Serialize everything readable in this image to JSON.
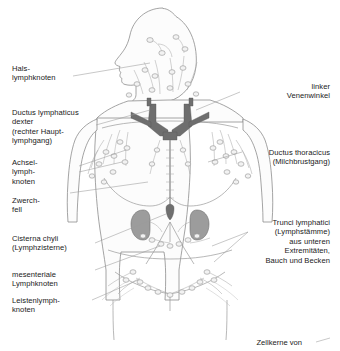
{
  "diagram": {
    "background_color": "#ffffff",
    "line_color": "#8a8a8a",
    "organ_fill": "#9a9a9a",
    "vessel_fill": "#6e6e6e",
    "body_fill": "#fbfbfb"
  },
  "labels_left": [
    {
      "id": "hals",
      "text": "Hals-\nlymphknoten"
    },
    {
      "id": "ductus-lymphaticus-dexter",
      "text": "Ductus lymphaticus\ndexter\n(rechter Haupt-\nlymphgang)"
    },
    {
      "id": "achsel",
      "text": "Achsel-\nlymph-\nknoten"
    },
    {
      "id": "zwerchfell",
      "text": "Zwerch-\nfell"
    },
    {
      "id": "cisterna-chyli",
      "text": "Cisterna chyli\n(Lymphzisterne)"
    },
    {
      "id": "mesenteriale",
      "text": "mesenteriale\nLymphknoten"
    },
    {
      "id": "leisten",
      "text": "Leistenlymph-\nknoten"
    }
  ],
  "labels_right": [
    {
      "id": "linker-venenwinkel",
      "text": "linker\nVenenwinkel"
    },
    {
      "id": "ductus-thoracicus",
      "text": "Ductus thoracicus\n(Milchbrustgang)"
    },
    {
      "id": "trunci-lymphatici",
      "text": "Trunci lymphatici\n(Lymphstämme)\naus unteren\nExtremitäten,\nBauch und Becken"
    }
  ],
  "footer": {
    "right_caption": "Zellkerne von",
    "left_caption": ""
  }
}
